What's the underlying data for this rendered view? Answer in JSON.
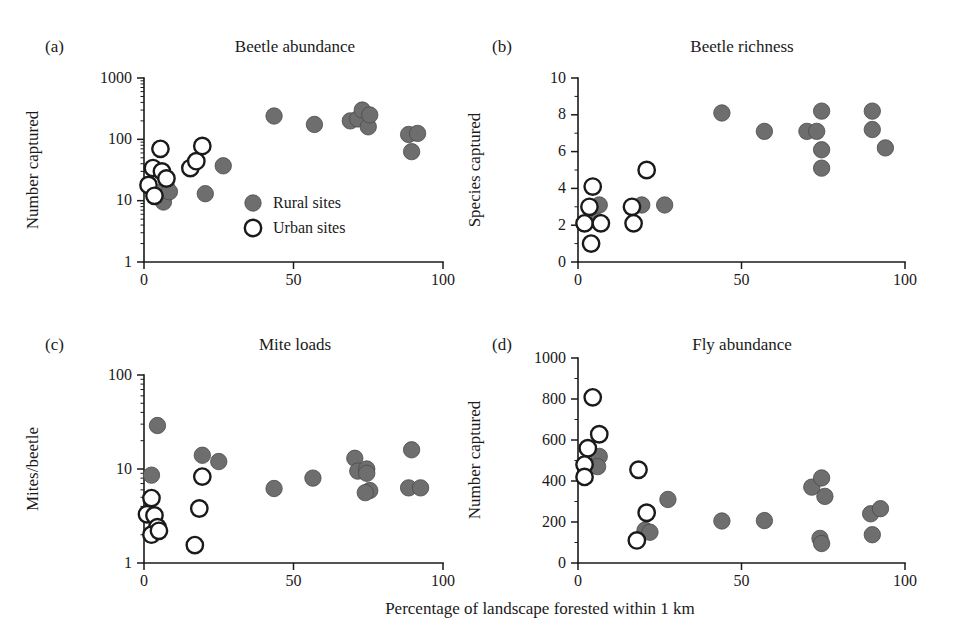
{
  "figure": {
    "shared_xlabel": "Percentage of landscape forested within 1 km",
    "marker_fill_color": "#6f6e6e",
    "marker_edge_color": "#4a4a4a",
    "axis_color": "#1a1a1a",
    "background_color": "#ffffff"
  },
  "legend": {
    "position": "panel-a-lower-right",
    "entries": [
      {
        "label": "Rural sites",
        "marker": "filled-circle"
      },
      {
        "label": "Urban sites",
        "marker": "open-circle"
      }
    ]
  },
  "chart_data": [
    {
      "id": "a",
      "panel_letter": "(a)",
      "type": "scatter",
      "title": "Beetle abundance",
      "xlabel": "Percentage of landscape forested within 1 km",
      "ylabel": "Number captured",
      "xscale": "linear",
      "yscale": "log",
      "xlim": [
        0,
        100
      ],
      "ylim": [
        1,
        1000
      ],
      "xticks": [
        0,
        50,
        100
      ],
      "xticklabels": [
        "0",
        "50",
        "100"
      ],
      "yticks": [
        1,
        10,
        100,
        1000
      ],
      "yticklabels": [
        "1",
        "10",
        "100",
        "1000"
      ],
      "grid": false,
      "series": [
        {
          "name": "Rural sites",
          "marker": "filled-circle",
          "points": [
            [
              5.5,
              12
            ],
            [
              6.5,
              9.5
            ],
            [
              7.5,
              17
            ],
            [
              8.5,
              14
            ],
            [
              20.5,
              13
            ],
            [
              26.5,
              37
            ],
            [
              43.5,
              240
            ],
            [
              57,
              175
            ],
            [
              69,
              200
            ],
            [
              71.5,
              215
            ],
            [
              73,
              300
            ],
            [
              75,
              160
            ],
            [
              75.5,
              250
            ],
            [
              88.5,
              120
            ],
            [
              91.5,
              125
            ],
            [
              89.5,
              63
            ]
          ]
        },
        {
          "name": "Urban sites",
          "marker": "open-circle",
          "points": [
            [
              1.5,
              18
            ],
            [
              3.0,
              34
            ],
            [
              3.5,
              12
            ],
            [
              5.5,
              70
            ],
            [
              6.0,
              30
            ],
            [
              7.5,
              23
            ],
            [
              15.5,
              34
            ],
            [
              17.5,
              44
            ],
            [
              19.5,
              78
            ]
          ]
        }
      ]
    },
    {
      "id": "b",
      "panel_letter": "(b)",
      "type": "scatter",
      "title": "Beetle richness",
      "xlabel": "Percentage of landscape forested within 1 km",
      "ylabel": "Species captured",
      "xscale": "linear",
      "yscale": "linear",
      "xlim": [
        0,
        100
      ],
      "ylim": [
        0,
        10
      ],
      "xticks": [
        0,
        50,
        100
      ],
      "xticklabels": [
        "0",
        "50",
        "100"
      ],
      "yticks": [
        0,
        2,
        4,
        6,
        8,
        10
      ],
      "yticklabels": [
        "0",
        "2",
        "4",
        "6",
        "8",
        "10"
      ],
      "grid": false,
      "series": [
        {
          "name": "Rural sites",
          "marker": "filled-circle",
          "points": [
            [
              6.5,
              3.1
            ],
            [
              6.0,
              2.2
            ],
            [
              19.5,
              3.1
            ],
            [
              26.5,
              3.1
            ],
            [
              44,
              8.1
            ],
            [
              57,
              7.1
            ],
            [
              70,
              7.1
            ],
            [
              73,
              7.1
            ],
            [
              74.5,
              8.2
            ],
            [
              74.5,
              6.1
            ],
            [
              74.5,
              5.1
            ],
            [
              90,
              8.2
            ],
            [
              90,
              7.2
            ],
            [
              94,
              6.2
            ]
          ]
        },
        {
          "name": "Urban sites",
          "marker": "open-circle",
          "points": [
            [
              4.5,
              4.1
            ],
            [
              3.5,
              3.0
            ],
            [
              2.0,
              2.1
            ],
            [
              4.0,
              1.0
            ],
            [
              7.0,
              2.1
            ],
            [
              16.5,
              3.0
            ],
            [
              17.0,
              2.1
            ],
            [
              21.0,
              5.0
            ]
          ]
        }
      ]
    },
    {
      "id": "c",
      "panel_letter": "(c)",
      "type": "scatter",
      "title": "Mite loads",
      "xlabel": "Percentage of landscape forested within 1 km",
      "ylabel": "Mites/beetle",
      "xscale": "linear",
      "yscale": "log",
      "xlim": [
        0,
        100
      ],
      "ylim": [
        1,
        100
      ],
      "xticks": [
        0,
        50,
        100
      ],
      "xticklabels": [
        "0",
        "50",
        "100"
      ],
      "yticks": [
        1,
        10,
        100
      ],
      "yticklabels": [
        "1",
        "10",
        "100"
      ],
      "grid": false,
      "series": [
        {
          "name": "Rural sites",
          "marker": "filled-circle",
          "points": [
            [
              4.5,
              29
            ],
            [
              2.5,
              8.6
            ],
            [
              19.5,
              14
            ],
            [
              25.0,
              12
            ],
            [
              43.5,
              6.2
            ],
            [
              56.5,
              8.0
            ],
            [
              70.5,
              13
            ],
            [
              71.5,
              9.5
            ],
            [
              74.5,
              10
            ],
            [
              74.5,
              9.0
            ],
            [
              75.5,
              5.9
            ],
            [
              74.0,
              5.6
            ],
            [
              89.5,
              16
            ],
            [
              88.5,
              6.3
            ],
            [
              92.5,
              6.3
            ]
          ]
        },
        {
          "name": "Urban sites",
          "marker": "open-circle",
          "points": [
            [
              2.5,
              4.9
            ],
            [
              1.0,
              3.3
            ],
            [
              3.5,
              3.2
            ],
            [
              4.5,
              2.4
            ],
            [
              2.5,
              2.0
            ],
            [
              5.0,
              2.2
            ],
            [
              19.5,
              8.3
            ],
            [
              18.5,
              3.8
            ],
            [
              17.0,
              1.55
            ]
          ]
        }
      ]
    },
    {
      "id": "d",
      "panel_letter": "(d)",
      "type": "scatter",
      "title": "Fly abundance",
      "xlabel": "Percentage of landscape forested within 1 km",
      "ylabel": "Number captured",
      "xscale": "linear",
      "yscale": "linear",
      "xlim": [
        0,
        100
      ],
      "ylim": [
        0,
        1000
      ],
      "xticks": [
        0,
        50,
        100
      ],
      "xticklabels": [
        "0",
        "50",
        "100"
      ],
      "yticks": [
        0,
        200,
        400,
        600,
        800,
        1000
      ],
      "yticklabels": [
        "0",
        "200",
        "400",
        "600",
        "800",
        "1000"
      ],
      "grid": false,
      "series": [
        {
          "name": "Rural sites",
          "marker": "filled-circle",
          "points": [
            [
              6.5,
              520
            ],
            [
              6.0,
              470
            ],
            [
              20.5,
              160
            ],
            [
              22.0,
              150
            ],
            [
              27.5,
              310
            ],
            [
              44,
              205
            ],
            [
              57,
              207
            ],
            [
              71.5,
              370
            ],
            [
              74.5,
              415
            ],
            [
              75.5,
              325
            ],
            [
              74.0,
              120
            ],
            [
              74.5,
              95
            ],
            [
              89.5,
              240
            ],
            [
              92.5,
              265
            ],
            [
              90.0,
              138
            ]
          ]
        },
        {
          "name": "Urban sites",
          "marker": "open-circle",
          "points": [
            [
              4.5,
              808
            ],
            [
              6.5,
              628
            ],
            [
              3.0,
              560
            ],
            [
              2.0,
              480
            ],
            [
              2.0,
              420
            ],
            [
              18.5,
              455
            ],
            [
              21.0,
              245
            ],
            [
              18.0,
              110
            ]
          ]
        }
      ]
    }
  ]
}
